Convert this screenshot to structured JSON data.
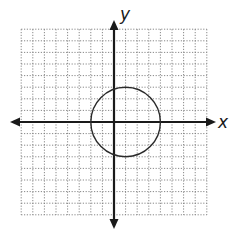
{
  "chart_data": {
    "type": "line",
    "title": "",
    "xlabel": "x",
    "ylabel": "y",
    "xlim": [
      -8,
      8
    ],
    "ylim": [
      -8,
      8
    ],
    "grid": true,
    "grid_style": "dotted",
    "grid_step": 1,
    "tick_labels": false,
    "shapes": [
      {
        "kind": "circle",
        "center": [
          1,
          0
        ],
        "radius": 3,
        "equation": "(x - 1)^2 + y^2 = 9"
      }
    ]
  },
  "colors": {
    "background": "#ffffff",
    "grid": "#7a7a7a",
    "axes": "#1a1a1a",
    "circle": "#2a2a2a"
  },
  "axes": {
    "x_label": "x",
    "y_label": "y"
  }
}
